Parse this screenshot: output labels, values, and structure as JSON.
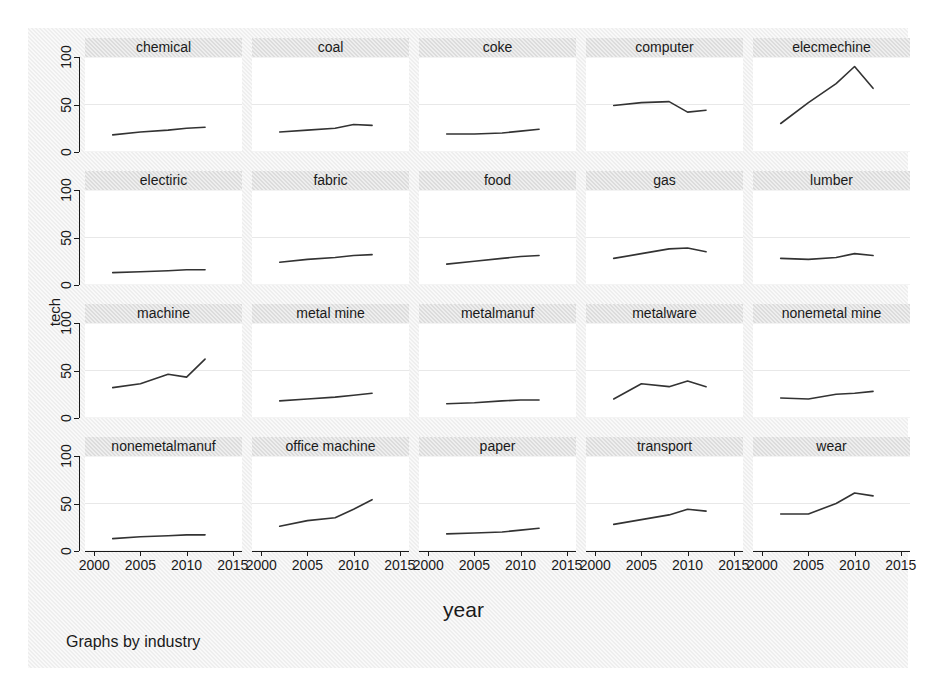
{
  "chart_data": {
    "type": "line",
    "title": "",
    "subtitle": "",
    "xlabel": "year",
    "ylabel": "tech",
    "caption": "Graphs by industry",
    "layout": "small-multiples",
    "grid_rows": 4,
    "grid_cols": 5,
    "grid": true,
    "legend": "none",
    "line_color": "#333333",
    "panel_header_color": "#dcdcdc",
    "plot_background": "#eeeeee",
    "xlim": [
      1999,
      2016
    ],
    "ylim": [
      0,
      100
    ],
    "xticks": [
      2000,
      2005,
      2010,
      2015
    ],
    "xtick_labels": [
      "2000",
      "2005",
      "2010",
      "2015"
    ],
    "yticks": [
      0,
      50,
      100
    ],
    "ytick_labels": [
      "0",
      "50",
      "100"
    ],
    "panels": [
      {
        "name": "chemical",
        "x": [
          2002,
          2005,
          2008,
          2010,
          2012
        ],
        "y": [
          18,
          21,
          23,
          25,
          26
        ]
      },
      {
        "name": "coal",
        "x": [
          2002,
          2005,
          2008,
          2010,
          2012
        ],
        "y": [
          21,
          23,
          25,
          29,
          28
        ]
      },
      {
        "name": "coke",
        "x": [
          2002,
          2005,
          2008,
          2010,
          2012
        ],
        "y": [
          19,
          19,
          20,
          22,
          24
        ]
      },
      {
        "name": "computer",
        "x": [
          2002,
          2005,
          2008,
          2010,
          2012
        ],
        "y": [
          49,
          52,
          53,
          42,
          44
        ]
      },
      {
        "name": "elecmechine",
        "x": [
          2002,
          2005,
          2008,
          2010,
          2012
        ],
        "y": [
          30,
          52,
          72,
          90,
          67
        ]
      },
      {
        "name": "electiric",
        "x": [
          2002,
          2005,
          2008,
          2010,
          2012
        ],
        "y": [
          13,
          14,
          15,
          16,
          16
        ]
      },
      {
        "name": "fabric",
        "x": [
          2002,
          2005,
          2008,
          2010,
          2012
        ],
        "y": [
          24,
          27,
          29,
          31,
          32
        ]
      },
      {
        "name": "food",
        "x": [
          2002,
          2005,
          2008,
          2010,
          2012
        ],
        "y": [
          22,
          25,
          28,
          30,
          31
        ]
      },
      {
        "name": "gas",
        "x": [
          2002,
          2005,
          2008,
          2010,
          2012
        ],
        "y": [
          28,
          33,
          38,
          39,
          35
        ]
      },
      {
        "name": "lumber",
        "x": [
          2002,
          2005,
          2008,
          2010,
          2012
        ],
        "y": [
          28,
          27,
          29,
          33,
          31
        ]
      },
      {
        "name": "machine",
        "x": [
          2002,
          2005,
          2008,
          2010,
          2012
        ],
        "y": [
          32,
          36,
          46,
          43,
          62
        ]
      },
      {
        "name": "metal mine",
        "x": [
          2002,
          2005,
          2008,
          2010,
          2012
        ],
        "y": [
          18,
          20,
          22,
          24,
          26
        ]
      },
      {
        "name": "metalmanuf",
        "x": [
          2002,
          2005,
          2008,
          2010,
          2012
        ],
        "y": [
          15,
          16,
          18,
          19,
          19
        ]
      },
      {
        "name": "metalware",
        "x": [
          2002,
          2005,
          2008,
          2010,
          2012
        ],
        "y": [
          20,
          36,
          33,
          39,
          33
        ]
      },
      {
        "name": "nonemetal mine",
        "x": [
          2002,
          2005,
          2008,
          2010,
          2012
        ],
        "y": [
          21,
          20,
          25,
          26,
          28
        ]
      },
      {
        "name": "nonemetalmanuf",
        "x": [
          2002,
          2005,
          2008,
          2010,
          2012
        ],
        "y": [
          13,
          15,
          16,
          17,
          17
        ]
      },
      {
        "name": "office machine",
        "x": [
          2002,
          2005,
          2008,
          2010,
          2012
        ],
        "y": [
          26,
          32,
          35,
          44,
          54
        ]
      },
      {
        "name": "paper",
        "x": [
          2002,
          2005,
          2008,
          2010,
          2012
        ],
        "y": [
          18,
          19,
          20,
          22,
          24
        ]
      },
      {
        "name": "transport",
        "x": [
          2002,
          2005,
          2008,
          2010,
          2012
        ],
        "y": [
          28,
          33,
          38,
          44,
          42
        ]
      },
      {
        "name": "wear",
        "x": [
          2002,
          2005,
          2008,
          2010,
          2012
        ],
        "y": [
          39,
          39,
          50,
          61,
          58
        ]
      }
    ]
  }
}
